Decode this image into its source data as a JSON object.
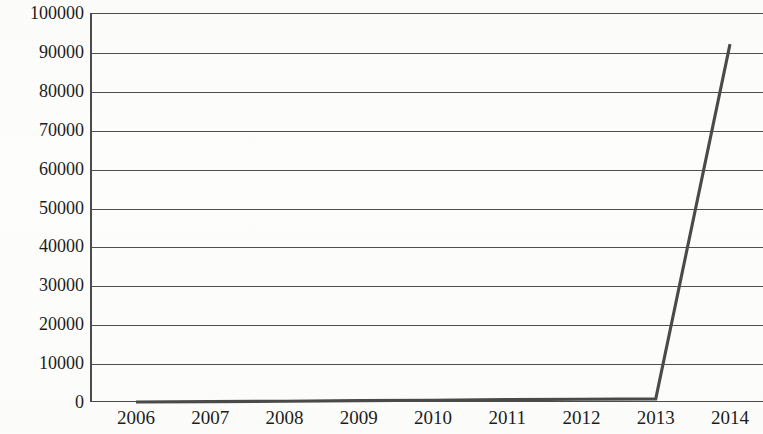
{
  "chart_data": {
    "type": "line",
    "title": "",
    "subtitle": "",
    "xlabel": "",
    "ylabel": "",
    "categories": [
      "2006",
      "2007",
      "2008",
      "2009",
      "2010",
      "2011",
      "2012",
      "2013",
      "2014"
    ],
    "x": [
      2006,
      2007,
      2008,
      2009,
      2010,
      2011,
      2012,
      2013,
      2014
    ],
    "series": [
      {
        "name": "",
        "values": [
          0,
          100,
          200,
          350,
          450,
          600,
          700,
          800,
          92000
        ]
      }
    ],
    "ylim": [
      0,
      100000
    ],
    "ytick_values": [
      0,
      10000,
      20000,
      30000,
      40000,
      50000,
      60000,
      70000,
      80000,
      90000,
      100000
    ],
    "ytick_labels": [
      "0",
      "10000",
      "20000",
      "30000",
      "40000",
      "50000",
      "60000",
      "70000",
      "80000",
      "90000",
      "100000"
    ],
    "xtick_labels": [
      "2006",
      "2007",
      "2008",
      "2009",
      "2010",
      "2011",
      "2012",
      "2013",
      "2014"
    ],
    "grid": true,
    "grid_axis": "y",
    "legend": false,
    "legend_position": "none",
    "annotations": [],
    "colors": {
      "line": "#4a4a4a",
      "grid": "#4f4f4f",
      "axis": "#4b4b4b",
      "text": "#1c1c1c",
      "background": "#fdfdfc"
    }
  }
}
